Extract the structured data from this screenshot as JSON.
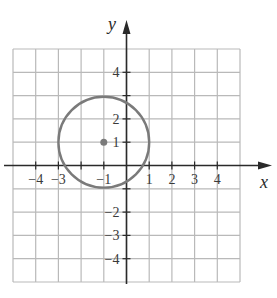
{
  "chart_data": {
    "type": "scatter",
    "title": "",
    "xlabel": "x",
    "ylabel": "y",
    "xlim": [
      -5,
      5
    ],
    "ylim": [
      -5,
      5
    ],
    "grid": true,
    "x_ticks": [
      -4,
      -3,
      -1,
      1,
      2,
      3,
      4
    ],
    "x_tick_labels": [
      "−4",
      "−3",
      "−1",
      "1",
      "2",
      "3",
      "4"
    ],
    "y_ticks": [
      4,
      2,
      1,
      -2,
      -3,
      -4
    ],
    "y_tick_labels": [
      "4",
      "2",
      "1",
      "−2",
      "−3",
      "−4"
    ],
    "shapes": [
      {
        "kind": "circle",
        "center": [
          -1,
          1
        ],
        "radius": 2,
        "equation": "(x+1)^2 + (y-1)^2 = 4"
      }
    ],
    "points": [
      {
        "x": -1,
        "y": 1,
        "label": "center"
      }
    ],
    "colors": {
      "grid": "#b9b9b9",
      "axes": "#2a2a2a",
      "circle": "#7a7a7a",
      "point": "#7a7a7a"
    }
  },
  "labels": {
    "x_axis": "x",
    "y_axis": "y"
  }
}
